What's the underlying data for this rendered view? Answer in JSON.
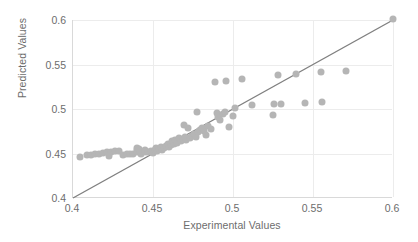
{
  "chart_data": {
    "type": "scatter",
    "title": "",
    "xlabel": "Experimental Values",
    "ylabel": "Predicted Values",
    "xlim": [
      0.4,
      0.6
    ],
    "ylim": [
      0.4,
      0.6
    ],
    "xticks": [
      "0.4",
      "0.45",
      "0.5",
      "0.55",
      "0.6"
    ],
    "yticks": [
      "0.4",
      "0.45",
      "0.5",
      "0.55",
      "0.6"
    ],
    "xtick_values": [
      0.4,
      0.45,
      0.5,
      0.55,
      0.6
    ],
    "ytick_values": [
      0.4,
      0.45,
      0.5,
      0.55,
      0.6
    ],
    "grid": true,
    "legend": "none",
    "series": [
      {
        "name": "Predicted vs Experimental",
        "marker": "circle",
        "color": "#b5b5b5",
        "points": [
          [
            0.4045,
            0.4465
          ],
          [
            0.409,
            0.4478
          ],
          [
            0.4115,
            0.448
          ],
          [
            0.414,
            0.4492
          ],
          [
            0.4165,
            0.4497
          ],
          [
            0.419,
            0.4503
          ],
          [
            0.4215,
            0.4512
          ],
          [
            0.424,
            0.4519
          ],
          [
            0.4228,
            0.4476
          ],
          [
            0.4265,
            0.4524
          ],
          [
            0.429,
            0.4529
          ],
          [
            0.431,
            0.4487
          ],
          [
            0.4335,
            0.449
          ],
          [
            0.4355,
            0.4494
          ],
          [
            0.4372,
            0.4497
          ],
          [
            0.4398,
            0.4538
          ],
          [
            0.44,
            0.456
          ],
          [
            0.4402,
            0.4516
          ],
          [
            0.4415,
            0.4553
          ],
          [
            0.442,
            0.4521
          ],
          [
            0.4428,
            0.45
          ],
          [
            0.4448,
            0.4536
          ],
          [
            0.4452,
            0.4512
          ],
          [
            0.4468,
            0.4519
          ],
          [
            0.4485,
            0.4523
          ],
          [
            0.4498,
            0.4504
          ],
          [
            0.4512,
            0.4544
          ],
          [
            0.452,
            0.4567
          ],
          [
            0.4528,
            0.453
          ],
          [
            0.454,
            0.4552
          ],
          [
            0.4548,
            0.4575
          ],
          [
            0.4556,
            0.4538
          ],
          [
            0.457,
            0.456
          ],
          [
            0.4582,
            0.4583
          ],
          [
            0.4595,
            0.4607
          ],
          [
            0.46,
            0.4571
          ],
          [
            0.4612,
            0.4591
          ],
          [
            0.4618,
            0.464
          ],
          [
            0.463,
            0.4608
          ],
          [
            0.464,
            0.4653
          ],
          [
            0.4652,
            0.462
          ],
          [
            0.4665,
            0.4669
          ],
          [
            0.4672,
            0.4642
          ],
          [
            0.4688,
            0.4662
          ],
          [
            0.4695,
            0.4821
          ],
          [
            0.47,
            0.4684
          ],
          [
            0.4708,
            0.4649
          ],
          [
            0.472,
            0.4787
          ],
          [
            0.473,
            0.4672
          ],
          [
            0.4742,
            0.47
          ],
          [
            0.4755,
            0.4718
          ],
          [
            0.4768,
            0.4691
          ],
          [
            0.4775,
            0.4971
          ],
          [
            0.4782,
            0.4736
          ],
          [
            0.4795,
            0.476
          ],
          [
            0.4808,
            0.4781
          ],
          [
            0.4818,
            0.4752
          ],
          [
            0.483,
            0.471
          ],
          [
            0.4845,
            0.4805
          ],
          [
            0.4862,
            0.4779
          ],
          [
            0.4888,
            0.53
          ],
          [
            0.4898,
            0.4952
          ],
          [
            0.4908,
            0.4912
          ],
          [
            0.492,
            0.4878
          ],
          [
            0.4938,
            0.4948
          ],
          [
            0.495,
            0.4962
          ],
          [
            0.4955,
            0.532
          ],
          [
            0.4972,
            0.4795
          ],
          [
            0.4998,
            0.4924
          ],
          [
            0.501,
            0.5008
          ],
          [
            0.5058,
            0.5338
          ],
          [
            0.5118,
            0.504
          ],
          [
            0.5248,
            0.4928
          ],
          [
            0.5255,
            0.5053
          ],
          [
            0.5282,
            0.538
          ],
          [
            0.5302,
            0.5052
          ],
          [
            0.5392,
            0.5398
          ],
          [
            0.5452,
            0.507
          ],
          [
            0.5552,
            0.5412
          ],
          [
            0.5558,
            0.508
          ],
          [
            0.5708,
            0.5422
          ],
          [
            0.5998,
            0.6012
          ]
        ]
      }
    ],
    "reference_line": {
      "name": "y = x identity line",
      "color": "#808080",
      "from": [
        0.4,
        0.4
      ],
      "to": [
        0.6,
        0.6
      ]
    }
  }
}
